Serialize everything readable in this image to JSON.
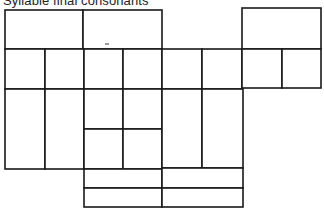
{
  "diagram": {
    "title": "Syllable final consonants",
    "line_color": "#1a1a1a",
    "background": "#ffffff",
    "cells": [
      {
        "id": "top-left-a",
        "x": 5,
        "y": 10,
        "w": 78,
        "h": 39
      },
      {
        "id": "top-left-b",
        "x": 83,
        "y": 10,
        "w": 79,
        "h": 39
      },
      {
        "id": "top-right",
        "x": 242,
        "y": 8,
        "w": 79,
        "h": 41
      },
      {
        "id": "row2-c1",
        "x": 5,
        "y": 49,
        "w": 40,
        "h": 40
      },
      {
        "id": "row2-c2",
        "x": 45,
        "y": 49,
        "w": 39,
        "h": 40
      },
      {
        "id": "row2-c3",
        "x": 84,
        "y": 49,
        "w": 39,
        "h": 40
      },
      {
        "id": "row2-c4",
        "x": 123,
        "y": 49,
        "w": 39,
        "h": 40
      },
      {
        "id": "row2-c5",
        "x": 162,
        "y": 49,
        "w": 40,
        "h": 40
      },
      {
        "id": "row2-c6",
        "x": 202,
        "y": 49,
        "w": 40,
        "h": 40
      },
      {
        "id": "row2-c7",
        "x": 242,
        "y": 49,
        "w": 40,
        "h": 39
      },
      {
        "id": "row2-c8",
        "x": 282,
        "y": 49,
        "w": 39,
        "h": 39
      },
      {
        "id": "row3-c1",
        "x": 5,
        "y": 89,
        "w": 40,
        "h": 80
      },
      {
        "id": "row3-c2",
        "x": 45,
        "y": 89,
        "w": 39,
        "h": 80
      },
      {
        "id": "row3-c3-top",
        "x": 84,
        "y": 89,
        "w": 39,
        "h": 40
      },
      {
        "id": "row3-c4-top",
        "x": 123,
        "y": 89,
        "w": 39,
        "h": 40
      },
      {
        "id": "row3-c3-bottom",
        "x": 84,
        "y": 129,
        "w": 39,
        "h": 40
      },
      {
        "id": "row3-c4-bottom",
        "x": 123,
        "y": 129,
        "w": 39,
        "h": 40
      },
      {
        "id": "row3-c5",
        "x": 162,
        "y": 89,
        "w": 40,
        "h": 79
      },
      {
        "id": "row3-c6",
        "x": 202,
        "y": 89,
        "w": 41,
        "h": 79
      },
      {
        "id": "bottom-left-1",
        "x": 84,
        "y": 169,
        "w": 78,
        "h": 19
      },
      {
        "id": "bottom-right-1",
        "x": 162,
        "y": 168,
        "w": 81,
        "h": 20
      },
      {
        "id": "bottom-left-2",
        "x": 84,
        "y": 188,
        "w": 78,
        "h": 19
      },
      {
        "id": "bottom-right-2",
        "x": 162,
        "y": 188,
        "w": 81,
        "h": 19
      }
    ]
  }
}
